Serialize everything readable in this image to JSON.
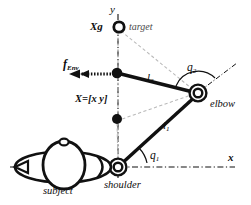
{
  "figure": {
    "background": "#ffffff",
    "ink": "#111111",
    "ghost": "#b8b8b8"
  },
  "axes": {
    "y_label": "y",
    "x_label": "x",
    "y_axis_style": "dash-dot vertical",
    "x_axis_style": "dash-dot horizontal"
  },
  "labels": {
    "target_point": "Xg",
    "target_name": "target",
    "force": "f",
    "force_sub": "Env",
    "hand_state": "X=[x  y]",
    "link2": "l",
    "link2_sub": "2",
    "link1": "l",
    "link1_sub": "1",
    "angle2": "q",
    "angle2_sub": "2",
    "angle1": "q",
    "angle1_sub": "1",
    "elbow": "elbow",
    "shoulder": "shoulder",
    "subject": "subject"
  },
  "geometry": {
    "shoulder": [
      118,
      167
    ],
    "elbow": [
      198,
      93
    ],
    "hand": [
      117,
      73
    ],
    "target": [
      119,
      27
    ],
    "mid_dot": [
      117,
      119
    ],
    "force_arrow_from": [
      112,
      74
    ],
    "force_arrow_to": [
      70,
      74
    ]
  }
}
